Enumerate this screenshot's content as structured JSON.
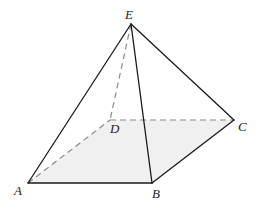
{
  "figure": {
    "type": "square pyramid",
    "colors": {
      "base_fill": "#f0f0f0",
      "solid_edge": "#1a1a1a",
      "hidden_edge": "#8a8a8a"
    },
    "vertices": {
      "A": {
        "label": "A",
        "x": 28,
        "y": 183
      },
      "B": {
        "label": "B",
        "x": 152,
        "y": 183
      },
      "C": {
        "label": "C",
        "x": 234,
        "y": 120
      },
      "D": {
        "label": "D",
        "x": 110,
        "y": 120
      },
      "E": {
        "label": "E",
        "x": 131,
        "y": 24
      }
    },
    "solid_edges": [
      "AB",
      "BC",
      "EA",
      "EB",
      "EC"
    ],
    "hidden_edges": [
      "AD",
      "DC",
      "ED"
    ],
    "shaded_face": "ABCD"
  }
}
